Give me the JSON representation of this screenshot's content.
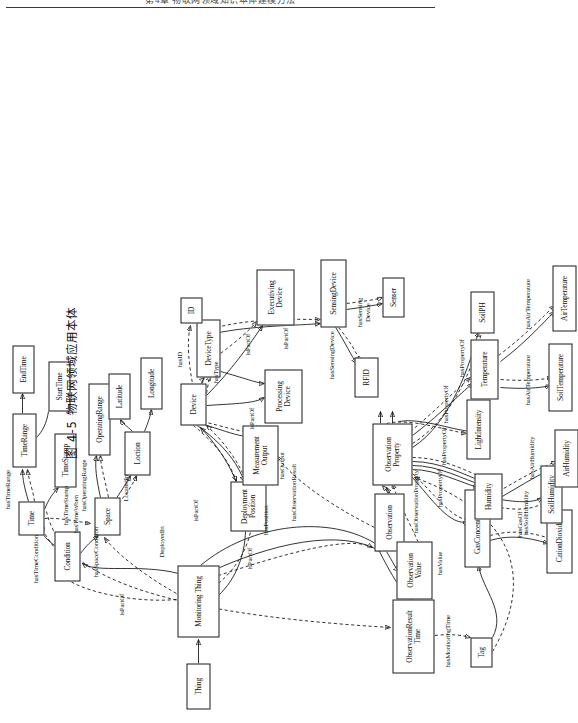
{
  "page": {
    "running_head": "第4章  物联网领域知识本体建模方法",
    "caption": "图 4-5  物联网领域应用本体"
  },
  "figure": {
    "type": "ontology-graph",
    "orientation": "rotated-90-ccw",
    "legend": {
      "solid_edge": "object property (solid arrow)",
      "dashed_edge": "subclass / inferred relation (dashed arrow)"
    },
    "nodes": [
      {
        "id": "thing",
        "label": "Thing",
        "x": 14,
        "y": 186,
        "w": 46,
        "h": 24
      },
      {
        "id": "monitoringThing",
        "label": "Monitoring Thing",
        "x": 86,
        "y": 177,
        "w": 72,
        "h": 42,
        "thick": true
      },
      {
        "id": "condition",
        "label": "Condition",
        "x": 142,
        "y": 54,
        "w": 50,
        "h": 26
      },
      {
        "id": "time",
        "label": "Time",
        "x": 188,
        "y": 18,
        "w": 34,
        "h": 26
      },
      {
        "id": "timeRange",
        "label": "TimeRange",
        "x": 256,
        "y": 12,
        "w": 54,
        "h": 24,
        "thick": true
      },
      {
        "id": "endTime",
        "label": "EndTime",
        "x": 312,
        "y": 12,
        "w": 48,
        "h": 22
      },
      {
        "id": "startTime",
        "label": "StartTime",
        "x": 300,
        "y": 48,
        "w": 50,
        "h": 22
      },
      {
        "id": "timeStamp",
        "label": "TimeStamp",
        "x": 236,
        "y": 54,
        "w": 54,
        "h": 22
      },
      {
        "id": "operatingRange",
        "label": "OperatingRange",
        "x": 270,
        "y": 92,
        "w": 70,
        "h": 22
      },
      {
        "id": "space",
        "label": "Space",
        "x": 188,
        "y": 92,
        "w": 38,
        "h": 26
      },
      {
        "id": "location",
        "label": "Loction",
        "x": 250,
        "y": 124,
        "w": 42,
        "h": 26
      },
      {
        "id": "latitude",
        "label": "Latitude",
        "x": 306,
        "y": 110,
        "w": 44,
        "h": 22
      },
      {
        "id": "longitude",
        "label": "Longitude",
        "x": 316,
        "y": 140,
        "w": 50,
        "h": 22
      },
      {
        "id": "deploymentPosition",
        "label": "Deployment\nPosition",
        "x": 192,
        "y": 228,
        "w": 50,
        "h": 36
      },
      {
        "id": "measurementOutput",
        "label": "Measurement\nOutput",
        "x": 238,
        "y": 238,
        "w": 60,
        "h": 36
      },
      {
        "id": "device",
        "label": "Device",
        "x": 298,
        "y": 180,
        "w": 42,
        "h": 26,
        "thick": true
      },
      {
        "id": "deviceType",
        "label": "DeviceType",
        "x": 348,
        "y": 196,
        "w": 56,
        "h": 24,
        "thick": true
      },
      {
        "id": "processingDevice",
        "label": "Processing\nDevice",
        "x": 300,
        "y": 266,
        "w": 54,
        "h": 36
      },
      {
        "id": "executivingDevice",
        "label": "Executiving\nDevice",
        "x": 398,
        "y": 256,
        "w": 56,
        "h": 38
      },
      {
        "id": "sensingDevice",
        "label": "SensingDevice",
        "x": 396,
        "y": 322,
        "w": 66,
        "h": 24
      },
      {
        "id": "rfid",
        "label": "RFID",
        "x": 352,
        "y": 358,
        "w": 40,
        "h": 24
      },
      {
        "id": "sensor",
        "label": "Senser",
        "x": 408,
        "y": 384,
        "w": 40,
        "h": 22
      },
      {
        "id": "id",
        "label": "ID",
        "x": 400,
        "y": 186,
        "w": 26,
        "h": 22
      },
      {
        "id": "observation",
        "label": "Observation",
        "x": 172,
        "y": 374,
        "w": 58,
        "h": 28,
        "thick": true
      },
      {
        "id": "observationResultTime",
        "label": "ObservationResult\nTime",
        "x": 50,
        "y": 392,
        "w": 74,
        "h": 42,
        "thick": true
      },
      {
        "id": "observationValue",
        "label": "Observation\nValue",
        "x": 138,
        "y": 396,
        "w": 58,
        "h": 36
      },
      {
        "id": "observationProperty",
        "label": "Observation\nProperty",
        "x": 238,
        "y": 374,
        "w": 62,
        "h": 38,
        "thick": true
      },
      {
        "id": "tag",
        "label": "Tag",
        "x": 64,
        "y": 470,
        "w": 30,
        "h": 22
      },
      {
        "id": "gasConcentration",
        "label": "GasConcentration",
        "x": 126,
        "y": 464,
        "w": 76,
        "h": 26,
        "thick": true
      },
      {
        "id": "cationDioxide",
        "label": "CationDioxide",
        "x": 118,
        "y": 542,
        "w": 62,
        "h": 26
      },
      {
        "id": "humidity",
        "label": "Humidity",
        "x": 190,
        "y": 472,
        "w": 46,
        "h": 28,
        "thick": true
      },
      {
        "id": "soilHumidity",
        "label": "SoilHumidity",
        "x": 174,
        "y": 544,
        "w": 56,
        "h": 22
      },
      {
        "id": "airHumidity",
        "label": "AirHumidity",
        "x": 230,
        "y": 556,
        "w": 56,
        "h": 24
      },
      {
        "id": "lightIntensity",
        "label": "LightIntensity",
        "x": 264,
        "y": 468,
        "w": 58,
        "h": 24
      },
      {
        "id": "temperature",
        "label": "Temperature",
        "x": 320,
        "y": 474,
        "w": 58,
        "h": 26,
        "thick": true
      },
      {
        "id": "soilTemperature",
        "label": "SoilTemperature",
        "x": 306,
        "y": 552,
        "w": 66,
        "h": 24
      },
      {
        "id": "airTemperature",
        "label": "AirTemperature",
        "x": 386,
        "y": 556,
        "w": 64,
        "h": 24
      },
      {
        "id": "soilPH",
        "label": "SoilPH",
        "x": 390,
        "y": 472,
        "w": 40,
        "h": 24
      }
    ],
    "edge_labels": [
      {
        "id": "isPartOf-thing",
        "text": "isPartOf"
      },
      {
        "id": "hasTimeCondition",
        "text": "hasTimeCondition"
      },
      {
        "id": "hasTimeRange",
        "text": "hasTimeRange"
      },
      {
        "id": "hasTimeStamp",
        "text": "hasTimeStamp"
      },
      {
        "id": "hasOperatingRange",
        "text": "hasOperatingRange"
      },
      {
        "id": "hasSpaceCondition",
        "text": "hasSpaceCondition"
      },
      {
        "id": "locatedIn",
        "text": "LocatedIn"
      },
      {
        "id": "deployedIn",
        "text": "DeployedIn"
      },
      {
        "id": "isPartOf-observation",
        "text": "isPartOf"
      },
      {
        "id": "hasTimeWhen",
        "text": "hasTimeWhen"
      },
      {
        "id": "hasMonitoringTime",
        "text": "hasMonitoringTime"
      },
      {
        "id": "isPartOf-device",
        "text": "isPartOf"
      },
      {
        "id": "hasPosition",
        "text": "hasPosition"
      },
      {
        "id": "hasOutput",
        "text": "hasOutput"
      },
      {
        "id": "hasObservationResult",
        "text": "hasObservationResult"
      },
      {
        "id": "hasObservationProperty",
        "text": "hasObservationProperty"
      },
      {
        "id": "hasValue",
        "text": "hasValue"
      },
      {
        "id": "hasID",
        "text": "hasID"
      },
      {
        "id": "hasType",
        "text": "hasType"
      },
      {
        "id": "isPartOf-processing",
        "text": "isPartOf"
      },
      {
        "id": "isPartOf-executiving",
        "text": "isPartOf"
      },
      {
        "id": "isPartOf-sensing",
        "text": "isPartOf"
      },
      {
        "id": "hasSensingDevice-rfid",
        "text": "hasSensingDevice"
      },
      {
        "id": "hasSensingDevice-sensor",
        "text": "hasSensing\nDevice"
      },
      {
        "id": "hasGasOf",
        "text": "hasGasOf"
      },
      {
        "id": "hasPropertyOf-gas",
        "text": "hasPropertyOf"
      },
      {
        "id": "hasSoilHumidity",
        "text": "hasSoilHumidity"
      },
      {
        "id": "hasAirHumidity",
        "text": "hasAirHumidity"
      },
      {
        "id": "hasPropertyOf-light",
        "text": "hasPropertyOf"
      },
      {
        "id": "hasPropertyOf-temp",
        "text": "hasPropertyOf"
      },
      {
        "id": "hasAirTemperature-soil",
        "text": "hasAirTemperature"
      },
      {
        "id": "hasAirTemperature-air",
        "text": "hasAirTemperature"
      },
      {
        "id": "hasPropertyOf-ph",
        "text": "hasPropertyOf"
      }
    ]
  }
}
